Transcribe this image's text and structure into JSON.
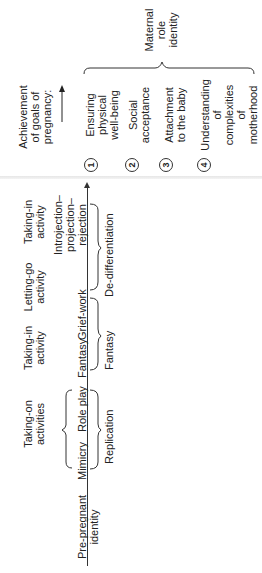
{
  "diagram": {
    "orientation": "rotated-90-ccw",
    "stages": [
      {
        "activity": "Pre-pregnant identity",
        "axis_labels": []
      },
      {
        "activity": "Taking-on activities",
        "axis_labels": [
          "Mimicry",
          "Role play"
        ],
        "bracket_below": "Replication"
      },
      {
        "activity": "Taking-in activity",
        "axis_labels": [
          "Fantasy"
        ],
        "bracket_below": "Fantasy"
      },
      {
        "activity": "Letting-go activity",
        "axis_labels": [
          "Grief-work"
        ],
        "bracket_below": "De-differentiation"
      },
      {
        "activity": "Taking-in activity",
        "axis_labels": [
          "Introjection–projection–rejection"
        ]
      }
    ],
    "labels": {
      "pre_pregnant_1": "Pre-pregnant",
      "pre_pregnant_2": "identity",
      "taking_on_1": "Taking-on",
      "taking_on_2": "activities",
      "mimicry": "Mimicry",
      "role_play": "Role play",
      "replication": "Replication",
      "taking_in_a_1": "Taking-in",
      "taking_in_a_2": "activity",
      "fantasy_axis": "Fantasy",
      "fantasy_bracket": "Fantasy",
      "letting_go_1": "Letting-go",
      "letting_go_2": "activity",
      "grief_work": "Grief-work",
      "de_differentiation": "De-differentiation",
      "taking_in_b_1": "Taking-in",
      "taking_in_b_2": "activity",
      "introjection_1": "Introjection–",
      "introjection_2": "projection–",
      "introjection_3": "rejection"
    },
    "goals": {
      "heading_1": "Achievement",
      "heading_2": "of goals of",
      "heading_3": "pregnancy:",
      "items": [
        {
          "num": "1",
          "l1": "Ensuring",
          "l2": "physical",
          "l3": "well-being"
        },
        {
          "num": "2",
          "l1": "Social",
          "l2": "acceptance"
        },
        {
          "num": "3",
          "l1": "Attachment",
          "l2": "to the baby"
        },
        {
          "num": "4",
          "l1": "Understanding",
          "l2": "of",
          "l3": "complexities",
          "l4": "of",
          "l5": "motherhood"
        }
      ],
      "outcome_1": "Maternal",
      "outcome_2": "role",
      "outcome_3": "identity"
    }
  }
}
